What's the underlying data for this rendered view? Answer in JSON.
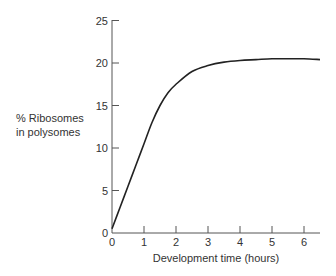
{
  "chart_data": {
    "type": "line",
    "title": "",
    "xlabel": "Development time (hours)",
    "ylabel": "% Ribosomes in polysomes",
    "ylabel_lines": [
      "% Ribosomes",
      "in polysomes"
    ],
    "xlim": [
      0,
      6.5
    ],
    "ylim": [
      0,
      25
    ],
    "xticks": [
      0,
      1,
      2,
      3,
      4,
      5,
      6
    ],
    "yticks": [
      0,
      5,
      10,
      15,
      20,
      25
    ],
    "grid": false,
    "series": [
      {
        "name": "% Ribosomes in polysomes",
        "x": [
          0,
          0.25,
          0.5,
          0.75,
          1.0,
          1.25,
          1.5,
          1.75,
          2.0,
          2.5,
          3.0,
          3.5,
          4.0,
          4.5,
          5.0,
          5.5,
          6.0,
          6.5
        ],
        "values": [
          0.5,
          3.0,
          5.5,
          8.0,
          10.5,
          13.0,
          15.0,
          16.5,
          17.5,
          19.0,
          19.7,
          20.1,
          20.3,
          20.4,
          20.5,
          20.5,
          20.5,
          20.4
        ]
      }
    ]
  }
}
